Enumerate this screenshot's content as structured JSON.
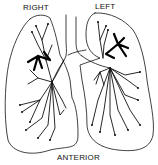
{
  "diagram": {
    "labels": {
      "right": "RIGHT",
      "left": "LEFT",
      "anterior": "ANTERIOR"
    },
    "colors": {
      "stroke": "#111111",
      "background": "#ffffff"
    }
  }
}
